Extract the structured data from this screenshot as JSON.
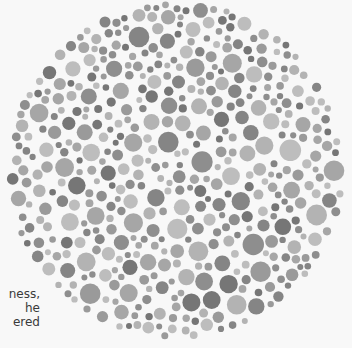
{
  "document": {
    "figure": {
      "type": "color-vision-test-plate",
      "description": "Circular plate of packed grayscale dots (Ishihara-style)",
      "center": [
        176,
        170
      ],
      "radius": 170,
      "background_color": "#f8f8f8",
      "dot_colors": [
        "#8e8e8e",
        "#9a9a9a",
        "#b3b3b3",
        "#bdbdbd",
        "#a6a6a6",
        "#767676",
        "#858585"
      ],
      "dot_min_radius": 3,
      "dot_max_radius": 11,
      "seed": 7
    },
    "side_text": {
      "lines": [
        "ness,",
        "he",
        "ered"
      ]
    }
  }
}
